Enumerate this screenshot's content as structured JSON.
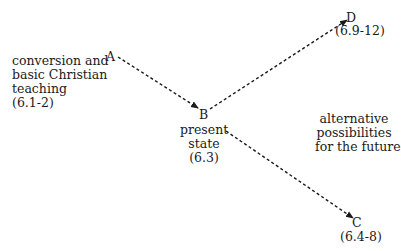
{
  "nodes": {
    "A": {
      "label": "A",
      "description": [
        "conversion and",
        "basic Christian",
        "teaching",
        "(6.1-2)"
      ]
    },
    "B": {
      "label": "B",
      "description": [
        "present",
        "state",
        "(6.3)"
      ]
    },
    "C": {
      "label": "C",
      "reference": "(6.4-8)"
    },
    "D": {
      "label": "D",
      "reference": "(6.9-12)"
    }
  },
  "annotation": [
    "alternative",
    "possibilities",
    "for the future"
  ],
  "edges": [
    {
      "from": "A",
      "to": "B",
      "style": "dashed-arrow"
    },
    {
      "from": "B",
      "to": "D",
      "style": "dashed-arrow"
    },
    {
      "from": "B",
      "to": "C",
      "style": "dashed-arrow"
    }
  ]
}
